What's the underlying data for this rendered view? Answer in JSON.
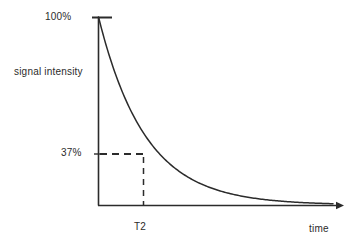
{
  "figure": {
    "title": "",
    "background_color": "#ffffff",
    "line_color": "#2b2b2b"
  },
  "axes": {
    "y_label": "signal intensity",
    "x_label": "time",
    "y_ticks": [
      {
        "label": "100%",
        "value": 100
      },
      {
        "label": "37%",
        "value": 37
      }
    ],
    "x_ticks": [
      {
        "label": "T2"
      }
    ]
  },
  "annotations": {
    "horizontal_dashed": "37% level to curve",
    "vertical_dashed": "T2 to curve"
  },
  "chart_data": {
    "type": "line",
    "title": "",
    "xlabel": "time",
    "ylabel": "signal intensity",
    "ylim": [
      0,
      100
    ],
    "xlim": [
      0,
      5
    ],
    "grid": false,
    "legend": null,
    "series": [
      {
        "name": "T2 decay",
        "equation": "S = 100 * exp(-t / T2)",
        "x": [
          0,
          0.25,
          0.5,
          0.75,
          1.0,
          1.25,
          1.5,
          1.75,
          2.0,
          2.5,
          3.0,
          3.5,
          4.0,
          4.5,
          5.0
        ],
        "y": [
          100,
          77.9,
          60.7,
          47.2,
          36.8,
          28.7,
          22.3,
          17.4,
          13.5,
          8.2,
          5.0,
          3.0,
          1.8,
          1.1,
          0.7
        ]
      }
    ],
    "markers": [
      {
        "label": "100%",
        "x": 0,
        "y": 100
      },
      {
        "label": "37%",
        "x": 1.0,
        "y": 36.8
      },
      {
        "label": "T2",
        "x": 1.0,
        "y": 0
      }
    ]
  }
}
